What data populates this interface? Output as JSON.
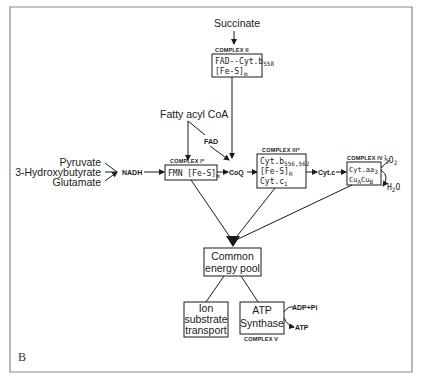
{
  "figure": {
    "panel_label": "B",
    "substrates": {
      "pyruvate": "Pyruvate",
      "hydroxybutyrate": "3-Hydroxybutyrate",
      "glutamate": "Glutamate"
    },
    "nadh": "NADH",
    "succinate": "Succinate",
    "fatty_acyl_coa": "Fatty acyl CoA",
    "fad": "FAD",
    "coq": "CoQ",
    "cytc": "Cyt.c",
    "complex1": {
      "title": "COMPLEX I*",
      "line1": "FMN [Fe-S]",
      "line1_sub": "m"
    },
    "complex2": {
      "title": "COMPLEX II",
      "line1": "FAD--Cyt.b",
      "line1_sub": "558",
      "line2": "[Fe-S]",
      "line2_sub": "m"
    },
    "complex3": {
      "title": "COMPLEX III*",
      "line1": "Cyt.b",
      "line1_sub": "556,562",
      "line2": "[Fe-S]",
      "line2_sub": "R",
      "line3": "Cyt.c",
      "line3_sub": "1"
    },
    "complex4": {
      "title": "COMPLEX IV",
      "line1": "Cyt.aa",
      "line1_sub": "3",
      "line2": "Cu",
      "line2_sub_a": "A",
      "line2_mid": "Cu",
      "line2_sub_b": "B"
    },
    "o2": "½O",
    "o2_sub": "2",
    "h2o": "H",
    "h2o_sub": "2",
    "h2o_end": "O",
    "energy_pool": {
      "line1": "Common",
      "line2": "energy pool"
    },
    "ion_transport": {
      "line1": "Ion",
      "line2": "substrate",
      "line3": "transport"
    },
    "atp_synthase": {
      "line1": "ATP",
      "line2": "Synthase",
      "title": "COMPLEX V"
    },
    "adp_pi": "ADP+Pi",
    "atp": "ATP"
  }
}
